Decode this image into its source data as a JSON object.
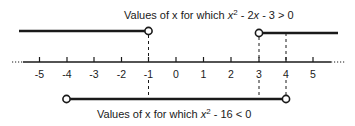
{
  "diagram": {
    "type": "number-line",
    "title_top": {
      "prefix": "Values of x for which ",
      "var": "x",
      "exp": "2",
      "middle": " - 2",
      "var2": "x",
      "suffix": " - 3 > 0"
    },
    "title_bottom": {
      "prefix": "Values of x for which ",
      "var": "x",
      "exp": "2",
      "suffix": " - 16 < 0"
    },
    "axis": {
      "min": -5,
      "max": 5,
      "ticks": [
        "-5",
        "-4",
        "-3",
        "-2",
        "-1",
        "0",
        "1",
        "2",
        "3",
        "4",
        "5"
      ],
      "continues_both_ways": true
    },
    "intervals": [
      {
        "name": "x-less-than-minus-1",
        "from": "-inf",
        "to": -1,
        "open_end": true
      },
      {
        "name": "x-greater-than-3",
        "from": 3,
        "to": "+inf",
        "open_start": true
      },
      {
        "name": "x-between-minus-4-and-4",
        "from": -4,
        "to": 4,
        "open_start": true,
        "open_end": true
      }
    ],
    "dashed_guides": [
      -1,
      3,
      4
    ],
    "colors": {
      "ink": "#1a1a1a",
      "background": "#ffffff"
    }
  }
}
